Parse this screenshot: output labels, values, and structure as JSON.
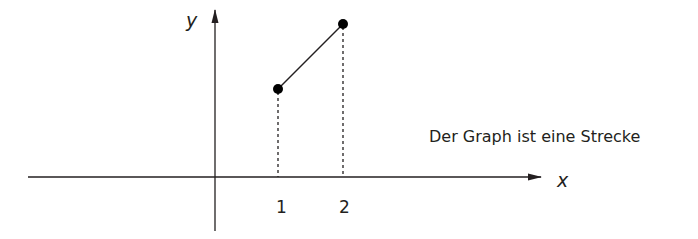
{
  "diagram": {
    "caption": "Der Graph ist eine Strecke",
    "axes": {
      "x_label": "x",
      "y_label": "y"
    },
    "ticks": [
      {
        "label": "1",
        "value": 1
      },
      {
        "label": "2",
        "value": 2
      }
    ],
    "points": [
      {
        "name": "start",
        "x": 1,
        "y_px": 89,
        "x_px": 278
      },
      {
        "name": "end",
        "x": 2,
        "y_px": 24,
        "x_px": 343
      }
    ],
    "colors": {
      "ink": "#231f20",
      "background": "#ffffff"
    }
  }
}
